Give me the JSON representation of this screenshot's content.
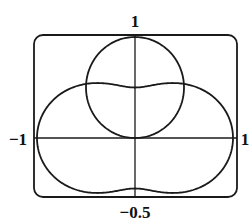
{
  "chart_data": {
    "type": "line",
    "title": "",
    "xlabel": "",
    "ylabel": "",
    "xlim": [
      -1,
      1
    ],
    "ylim": [
      -0.5,
      1
    ],
    "grid": false,
    "legend": null,
    "axis_labels": {
      "top": "1",
      "left": "−1",
      "right": "1",
      "bottom": "−0.5"
    },
    "series": [
      {
        "name": "circle",
        "polar_equation": "r = sin(theta)",
        "theta_range": [
          0,
          3.14159265
        ],
        "description": "circle of radius 0.5 centered at (0, 0.5)"
      },
      {
        "name": "peanut",
        "polar_equation": "r = (1 + cos^2(theta)) / 2",
        "theta_range": [
          0,
          6.2831853
        ],
        "key_points": {
          "r_at_0": 1,
          "r_at_pi_over_2": 0.5,
          "max_abs_y": 0.544
        }
      }
    ],
    "intersections": [
      {
        "x": -0.5,
        "y": 0.54
      },
      {
        "x": 0.5,
        "y": 0.54
      }
    ]
  },
  "style": {
    "stroke_color": "#1a1a1a",
    "background": "#ffffff"
  }
}
